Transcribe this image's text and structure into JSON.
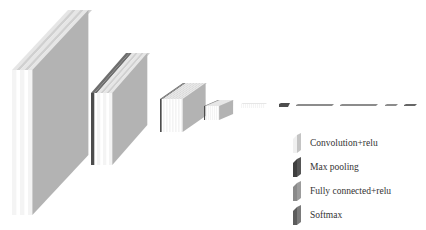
{
  "diagram": {
    "type": "cnn-architecture",
    "colors": {
      "conv_face": "#b3b3b3",
      "conv_edge": "#e6e6e6",
      "conv_front": "#f4f4f4",
      "pool": "#4d4d4d",
      "pool_top": "#6e6e6e",
      "fc": "#8c8c8c",
      "softmax": "#666666"
    },
    "blocks": [
      {
        "name": "conv-block-1",
        "x": 12,
        "y": 70,
        "w": 8,
        "h": 145,
        "dx": 56,
        "dy": -60,
        "slabs": [
          "conv",
          "conv",
          "conv"
        ],
        "face": true
      },
      {
        "name": "conv-block-2",
        "x": 91,
        "y": 93,
        "w": 6,
        "h": 72,
        "dx": 35,
        "dy": -40,
        "slabs": [
          "pool",
          "conv",
          "conv",
          "conv"
        ],
        "face": true
      },
      {
        "name": "conv-block-3",
        "x": 160,
        "y": 99,
        "w": 3,
        "h": 33,
        "dx": 23,
        "dy": -16,
        "slabs": [
          "pool",
          "conv",
          "conv",
          "conv",
          "conv",
          "conv",
          "conv",
          "conv"
        ],
        "face": true
      },
      {
        "name": "conv-block-4",
        "x": 204,
        "y": 106,
        "w": 2,
        "h": 14,
        "dx": 14,
        "dy": -6,
        "slabs": [
          "pool",
          "conv",
          "conv",
          "conv",
          "conv",
          "conv",
          "conv",
          "conv"
        ],
        "face": true
      },
      {
        "name": "conv-block-5",
        "x": 241,
        "y": 104,
        "w": 2,
        "h": 4,
        "dx": 2,
        "dy": -1,
        "slabs": [
          "conv",
          "conv",
          "conv",
          "conv",
          "conv",
          "conv",
          "conv",
          "conv",
          "conv",
          "conv",
          "conv",
          "conv"
        ],
        "face": false
      }
    ],
    "bars": [
      {
        "name": "pool-bar",
        "x": 279,
        "y": 103,
        "w": 11,
        "h": 4,
        "kind": "pool"
      },
      {
        "name": "fc-bar-1",
        "x": 296,
        "y": 104,
        "w": 38,
        "h": 2,
        "kind": "fc"
      },
      {
        "name": "fc-bar-2",
        "x": 340,
        "y": 104,
        "w": 38,
        "h": 2,
        "kind": "fc"
      },
      {
        "name": "fc-bar-3",
        "x": 385,
        "y": 104,
        "w": 13,
        "h": 2,
        "kind": "fc"
      },
      {
        "name": "softmax-bar",
        "x": 404,
        "y": 104,
        "w": 13,
        "h": 2,
        "kind": "softmax"
      }
    ]
  },
  "legend": {
    "items": [
      {
        "label": "Convolution+relu",
        "kind": "conv"
      },
      {
        "label": "Max pooling",
        "kind": "pool"
      },
      {
        "label": "Fully connected+relu",
        "kind": "fc"
      },
      {
        "label": "Softmax",
        "kind": "softmax"
      }
    ]
  }
}
